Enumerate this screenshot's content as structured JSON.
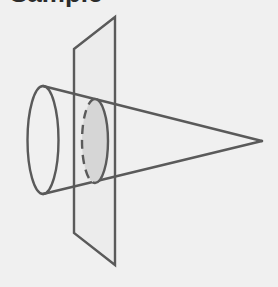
{
  "title": "Sample",
  "diagram": {
    "colors": {
      "background": "#f0f0f0",
      "stroke": "#5a5a5a",
      "section_fill": "#d6d6d6",
      "plane_fill": "#e9e9e9"
    },
    "elements": [
      {
        "name": "cone-base-ellipse",
        "shape": "ellipse"
      },
      {
        "name": "cone-apex",
        "shape": "point"
      },
      {
        "name": "cutting-plane",
        "shape": "parallelogram"
      },
      {
        "name": "cross-section",
        "shape": "shaded ellipse with dashed hidden edge"
      }
    ]
  }
}
